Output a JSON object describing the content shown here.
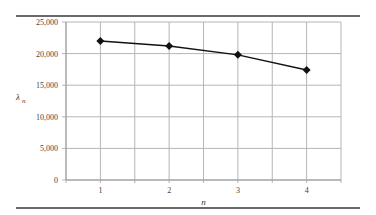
{
  "chart_data": {
    "type": "line",
    "title": "",
    "xlabel": "n",
    "ylabel": "λn",
    "categories": [
      "1",
      "2",
      "3",
      "4"
    ],
    "series": [
      {
        "name": "λn",
        "values": [
          22000,
          21200,
          19800,
          17400
        ],
        "marker": "diamond",
        "color": "#111111"
      }
    ],
    "yticks": [
      "0",
      "5,000",
      "10,000",
      "15,000",
      "20,000",
      "25,000"
    ],
    "ylim": [
      0,
      25000
    ],
    "grid": true,
    "legend": "none"
  },
  "labels": {
    "y_axis": "λ",
    "y_axis_sub": "n",
    "x_axis": "n"
  }
}
